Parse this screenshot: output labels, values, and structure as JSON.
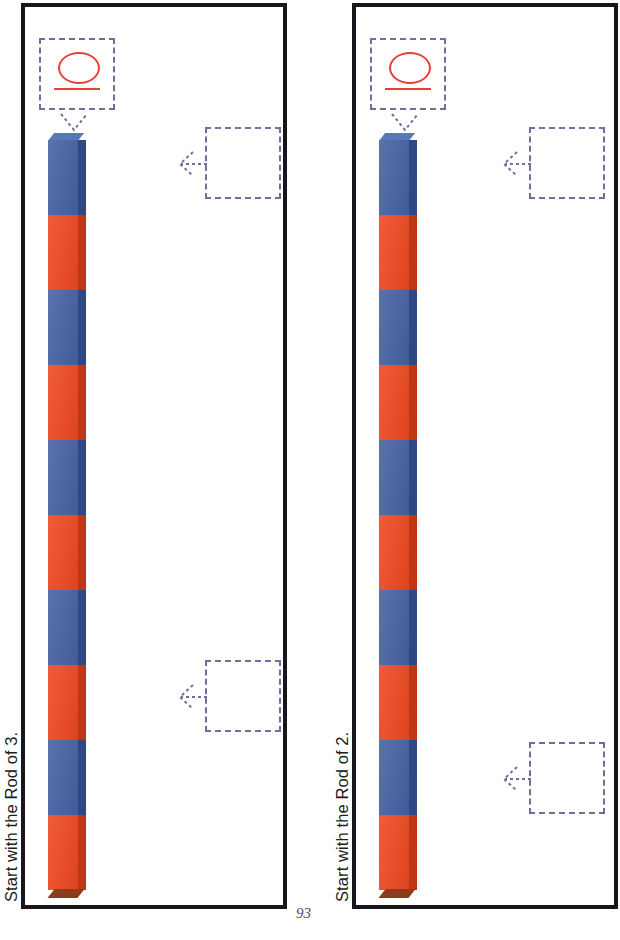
{
  "page": {
    "number": "93",
    "background_color": "#ffffff",
    "border_color": "#18161c"
  },
  "colors": {
    "rod_blue": "#4763a5",
    "rod_orange": "#ef4a22",
    "answer_red": "#e8413a",
    "dashed_box": "#6f6f9e",
    "text": "#201d20"
  },
  "panels": [
    {
      "id": "panel-1",
      "caption": "Start with the Rod of 3.",
      "answer_box": {
        "label": "answer-box-filled",
        "value": "10",
        "filled": true,
        "glyph": "ten-handwritten"
      },
      "empty_boxes": [
        {
          "label": "answer-box-empty",
          "value": "",
          "filled": false
        },
        {
          "label": "answer-box-empty",
          "value": "",
          "filled": false
        }
      ],
      "rod": {
        "unit_label": "Rod of 3",
        "segment_count": 10,
        "segment_colors": [
          "blue",
          "orange",
          "blue",
          "orange",
          "blue",
          "orange",
          "blue",
          "orange",
          "blue",
          "orange"
        ]
      }
    },
    {
      "id": "panel-2",
      "caption": "Start with the Rod of 2.",
      "answer_box": {
        "label": "answer-box-filled",
        "value": "10",
        "filled": true,
        "glyph": "ten-handwritten"
      },
      "empty_boxes": [
        {
          "label": "answer-box-empty",
          "value": "",
          "filled": false
        },
        {
          "label": "answer-box-empty",
          "value": "",
          "filled": false
        }
      ],
      "rod": {
        "unit_label": "Rod of 2",
        "segment_count": 10,
        "segment_colors": [
          "blue",
          "orange",
          "blue",
          "orange",
          "blue",
          "orange",
          "blue",
          "orange",
          "blue",
          "orange"
        ]
      }
    }
  ]
}
